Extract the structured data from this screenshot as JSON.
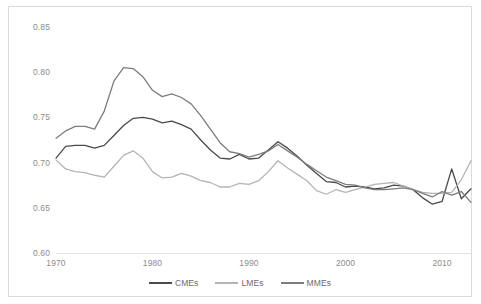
{
  "chart_data": {
    "type": "line",
    "title": "",
    "xlabel": "",
    "ylabel": "",
    "xlim": [
      1970,
      2013
    ],
    "ylim": [
      0.6,
      0.85
    ],
    "ytick_labels": [
      "0.85",
      "0.80",
      "0.75",
      "0.70",
      "0.65",
      "0.60"
    ],
    "ytick_values": [
      0.85,
      0.8,
      0.75,
      0.7,
      0.65,
      0.6
    ],
    "xtick_labels": [
      "1970",
      "1980",
      "1990",
      "2000",
      "2010"
    ],
    "xtick_values": [
      1970,
      1980,
      1990,
      2000,
      2010
    ],
    "grid": false,
    "legend_position": "bottom",
    "x": [
      1970,
      1971,
      1972,
      1973,
      1974,
      1975,
      1976,
      1977,
      1978,
      1979,
      1980,
      1981,
      1982,
      1983,
      1984,
      1985,
      1986,
      1987,
      1988,
      1989,
      1990,
      1991,
      1992,
      1993,
      1994,
      1995,
      1996,
      1997,
      1998,
      1999,
      2000,
      2001,
      2002,
      2003,
      2004,
      2005,
      2006,
      2007,
      2008,
      2009,
      2010,
      2011,
      2012,
      2013
    ],
    "series": [
      {
        "name": "CMEs",
        "color": "#4a4a4a",
        "values": [
          0.705,
          0.718,
          0.719,
          0.719,
          0.716,
          0.719,
          0.73,
          0.741,
          0.749,
          0.75,
          0.748,
          0.744,
          0.746,
          0.742,
          0.737,
          0.725,
          0.714,
          0.705,
          0.704,
          0.709,
          0.704,
          0.705,
          0.714,
          0.723,
          0.716,
          0.707,
          0.697,
          0.688,
          0.679,
          0.678,
          0.673,
          0.674,
          0.673,
          0.671,
          0.672,
          0.675,
          0.674,
          0.67,
          0.661,
          0.654,
          0.657,
          0.693,
          0.66,
          0.671
        ]
      },
      {
        "name": "LMEs",
        "color": "#b4b4b4",
        "values": [
          0.703,
          0.693,
          0.69,
          0.689,
          0.686,
          0.684,
          0.696,
          0.708,
          0.713,
          0.705,
          0.69,
          0.683,
          0.684,
          0.688,
          0.685,
          0.68,
          0.678,
          0.673,
          0.673,
          0.677,
          0.676,
          0.68,
          0.69,
          0.702,
          0.694,
          0.687,
          0.68,
          0.669,
          0.665,
          0.67,
          0.667,
          0.67,
          0.673,
          0.676,
          0.677,
          0.678,
          0.674,
          0.67,
          0.667,
          0.666,
          0.666,
          0.667,
          0.681,
          0.702
        ]
      },
      {
        "name": "MMEs",
        "color": "#7d7d7d",
        "values": [
          0.727,
          0.735,
          0.74,
          0.74,
          0.737,
          0.757,
          0.79,
          0.805,
          0.804,
          0.795,
          0.78,
          0.773,
          0.776,
          0.772,
          0.765,
          0.752,
          0.737,
          0.722,
          0.712,
          0.71,
          0.706,
          0.709,
          0.713,
          0.72,
          0.713,
          0.706,
          0.698,
          0.691,
          0.684,
          0.68,
          0.676,
          0.675,
          0.672,
          0.67,
          0.67,
          0.671,
          0.672,
          0.67,
          0.666,
          0.662,
          0.668,
          0.664,
          0.668,
          0.656
        ]
      }
    ]
  },
  "legend": {
    "items": [
      {
        "label": "CMEs",
        "color": "#4a4a4a"
      },
      {
        "label": "LMEs",
        "color": "#b4b4b4"
      },
      {
        "label": "MMEs",
        "color": "#7d7d7d"
      }
    ]
  }
}
